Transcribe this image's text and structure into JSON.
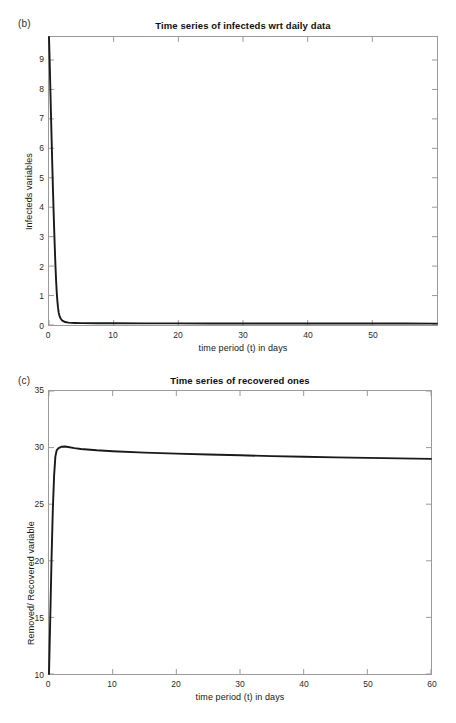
{
  "figure": {
    "background": "#ffffff",
    "line_color": "#1a1a1a",
    "axis_color": "#9a9a9a"
  },
  "panels": {
    "b": {
      "tag": "(b)",
      "title": "Time series of infecteds wrt daily data",
      "xlabel": "time period (t) in days",
      "ylabel": "Infecteds variables"
    },
    "c": {
      "tag": "(c)",
      "title": "Time series of recovered ones",
      "xlabel": "time period (t) in days",
      "ylabel": "Removed/ Recovered variable"
    }
  },
  "chart_data": [
    {
      "type": "line",
      "panel": "(b)",
      "title": "Time series of infecteds wrt daily data",
      "xlabel": "time period (t) in days",
      "ylabel": "Infecteds variables",
      "xlim": [
        0,
        60
      ],
      "ylim": [
        0,
        9.78
      ],
      "xticks": [
        0,
        10,
        20,
        30,
        40,
        50
      ],
      "xtick_labels": [
        "0",
        "10",
        "20",
        "30",
        "40",
        "50"
      ],
      "yticks": [
        0,
        1,
        2,
        3,
        4,
        5,
        6,
        7,
        8,
        9
      ],
      "ytick_labels": [
        "0",
        "1",
        "2",
        "3",
        "4",
        "5",
        "6",
        "7",
        "8",
        "9"
      ],
      "grid": false,
      "legend": null,
      "series": [
        {
          "name": "Infecteds",
          "color": "#1a1a1a",
          "x": [
            0,
            0.1,
            0.2,
            0.3,
            0.4,
            0.5,
            0.6,
            0.7,
            0.8,
            0.9,
            1.0,
            1.1,
            1.2,
            1.3,
            1.4,
            1.5,
            1.6,
            1.8,
            2.0,
            2.5,
            3.0,
            4.0,
            5.0,
            7.5,
            10,
            15,
            20,
            25,
            30,
            35,
            40,
            45,
            50,
            55,
            60
          ],
          "y": [
            9.78,
            9.0,
            8.1,
            7.2,
            6.35,
            5.5,
            4.7,
            3.95,
            3.25,
            2.6,
            2.0,
            1.5,
            1.1,
            0.8,
            0.58,
            0.42,
            0.33,
            0.22,
            0.16,
            0.1,
            0.08,
            0.07,
            0.065,
            0.06,
            0.058,
            0.056,
            0.054,
            0.053,
            0.052,
            0.051,
            0.05,
            0.05,
            0.049,
            0.049,
            0.048
          ]
        }
      ]
    },
    {
      "type": "line",
      "panel": "(c)",
      "title": "Time series of recovered ones",
      "xlabel": "time period (t) in days",
      "ylabel": "Removed/ Recovered variable",
      "xlim": [
        0,
        60
      ],
      "ylim": [
        10,
        35
      ],
      "xticks": [
        0,
        10,
        20,
        30,
        40,
        50,
        60
      ],
      "xtick_labels": [
        "0",
        "10",
        "20",
        "30",
        "40",
        "50",
        "60"
      ],
      "yticks": [
        10,
        15,
        20,
        25,
        30,
        35
      ],
      "ytick_labels": [
        "10",
        "15",
        "20",
        "25",
        "30",
        "35"
      ],
      "grid": false,
      "legend": null,
      "series": [
        {
          "name": "Removed/Recovered",
          "color": "#1a1a1a",
          "x": [
            0,
            0.2,
            0.4,
            0.6,
            0.8,
            1.0,
            1.2,
            1.5,
            2.0,
            2.5,
            3.0,
            4.0,
            5.0,
            7.5,
            10,
            15,
            20,
            25,
            30,
            35,
            40,
            45,
            50,
            55,
            60
          ],
          "y": [
            10.0,
            15.0,
            20.2,
            24.5,
            27.5,
            29.2,
            29.75,
            29.95,
            30.08,
            30.1,
            30.05,
            29.95,
            29.88,
            29.76,
            29.68,
            29.56,
            29.47,
            29.39,
            29.32,
            29.25,
            29.19,
            29.14,
            29.09,
            29.05,
            29.0
          ]
        }
      ]
    }
  ]
}
